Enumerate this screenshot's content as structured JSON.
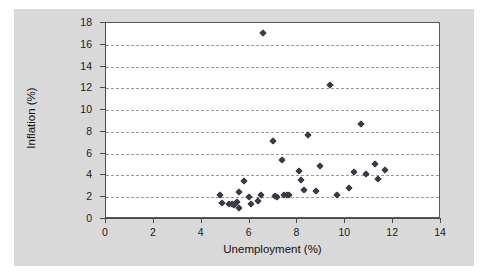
{
  "chart_data": {
    "type": "scatter",
    "title": "",
    "xlabel": "Unemployment (%)",
    "ylabel": "Inflation (%)",
    "xlim": [
      0,
      14
    ],
    "ylim": [
      0,
      18
    ],
    "xticks": [
      0,
      2,
      4,
      6,
      8,
      10,
      12,
      14
    ],
    "yticks": [
      0,
      2,
      4,
      6,
      8,
      10,
      12,
      14,
      16,
      18
    ],
    "grid": "horizontal-dashed",
    "legend": "none",
    "marker": "diamond",
    "marker_color": "#3a3a48",
    "points": [
      {
        "x": 4.8,
        "y": 2.1
      },
      {
        "x": 4.9,
        "y": 1.4
      },
      {
        "x": 5.2,
        "y": 1.3
      },
      {
        "x": 5.3,
        "y": 1.3
      },
      {
        "x": 5.4,
        "y": 1.2
      },
      {
        "x": 5.5,
        "y": 1.5
      },
      {
        "x": 5.6,
        "y": 0.9
      },
      {
        "x": 5.6,
        "y": 2.4
      },
      {
        "x": 5.8,
        "y": 3.4
      },
      {
        "x": 6.0,
        "y": 1.9
      },
      {
        "x": 6.1,
        "y": 1.3
      },
      {
        "x": 6.4,
        "y": 1.6
      },
      {
        "x": 6.5,
        "y": 2.1
      },
      {
        "x": 6.6,
        "y": 17.0
      },
      {
        "x": 7.0,
        "y": 7.1
      },
      {
        "x": 7.1,
        "y": 2.0
      },
      {
        "x": 7.2,
        "y": 1.9
      },
      {
        "x": 7.4,
        "y": 5.3
      },
      {
        "x": 7.5,
        "y": 2.1
      },
      {
        "x": 7.6,
        "y": 2.1
      },
      {
        "x": 7.7,
        "y": 2.1
      },
      {
        "x": 8.1,
        "y": 4.3
      },
      {
        "x": 8.2,
        "y": 3.5
      },
      {
        "x": 8.3,
        "y": 2.6
      },
      {
        "x": 8.5,
        "y": 7.6
      },
      {
        "x": 8.8,
        "y": 2.5
      },
      {
        "x": 9.0,
        "y": 4.8
      },
      {
        "x": 9.4,
        "y": 12.2
      },
      {
        "x": 9.7,
        "y": 2.1
      },
      {
        "x": 10.2,
        "y": 2.8
      },
      {
        "x": 10.4,
        "y": 4.2
      },
      {
        "x": 10.7,
        "y": 8.6
      },
      {
        "x": 10.9,
        "y": 4.0
      },
      {
        "x": 11.3,
        "y": 5.0
      },
      {
        "x": 11.4,
        "y": 3.6
      },
      {
        "x": 11.7,
        "y": 4.4
      }
    ]
  }
}
